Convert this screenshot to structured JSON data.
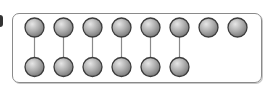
{
  "diagram": {
    "top_row": {
      "count": 8,
      "centers_x": [
        34.5,
        63.5,
        92.5,
        121.5,
        150.5,
        179.5,
        208.5,
        237.5
      ],
      "center_y": 27.5
    },
    "bottom_row": {
      "count": 6,
      "centers_x": [
        34.5,
        63.5,
        92.5,
        121.5,
        150.5,
        179.5
      ],
      "center_y": 67
    },
    "node_radius": 9.5,
    "connections": [
      [
        0,
        0
      ],
      [
        1,
        1
      ],
      [
        2,
        2
      ],
      [
        3,
        3
      ],
      [
        4,
        4
      ],
      [
        5,
        5
      ]
    ],
    "colors": {
      "node_light": "#e2e2e2",
      "node_mid": "#aeaeae",
      "node_dark": "#7c7c7c",
      "node_stroke": "#3c3c3c",
      "connector": "#8a8a8a",
      "frame": "#8a8a8a"
    }
  }
}
